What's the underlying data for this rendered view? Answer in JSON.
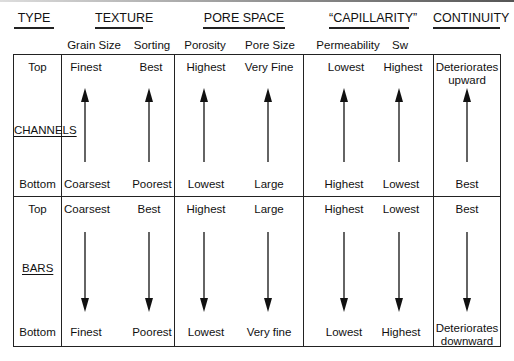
{
  "headers": {
    "type": "TYPE",
    "texture": "TEXTURE",
    "pore_space": "PORE SPACE",
    "capillarity": "“CAPILLARITY”",
    "continuity": "CONTINUITY"
  },
  "subheaders": {
    "grain_size": "Grain Size",
    "sorting": "Sorting",
    "porosity": "Porosity",
    "pore_size": "Pore Size",
    "permeability": "Permeability",
    "sw": "Sw"
  },
  "rows": {
    "channels": {
      "label": "CHANNELS",
      "position_top": "Top",
      "position_bottom": "Bottom",
      "arrow_direction": "up",
      "top": {
        "grain_size": "Finest",
        "sorting": "Best",
        "porosity": "Highest",
        "pore_size": "Very Fine",
        "permeability": "Lowest",
        "sw": "Highest",
        "continuity_line1": "Deteriorates",
        "continuity_line2": "upward"
      },
      "bottom": {
        "grain_size": "Coarsest",
        "sorting": "Poorest",
        "porosity": "Lowest",
        "pore_size": "Large",
        "permeability": "Highest",
        "sw": "Lowest",
        "continuity": "Best"
      }
    },
    "bars": {
      "label": "BARS",
      "position_top": "Top",
      "position_bottom": "Bottom",
      "arrow_direction": "down",
      "top": {
        "grain_size": "Coarsest",
        "sorting": "Best",
        "porosity": "Highest",
        "pore_size": "Large",
        "permeability": "Highest",
        "sw": "Lowest",
        "continuity": "Best"
      },
      "bottom": {
        "grain_size": "Finest",
        "sorting": "Poorest",
        "porosity": "Lowest",
        "pore_size": "Very fine",
        "permeability": "Lowest",
        "sw": "Highest",
        "continuity_line1": "Deteriorates",
        "continuity_line2": "downward"
      }
    }
  },
  "icons": {
    "arrow_up": "arrow-up-icon",
    "arrow_down": "arrow-down-icon"
  },
  "colors": {
    "line": "#222222",
    "text": "#111111",
    "background": "#ffffff"
  }
}
